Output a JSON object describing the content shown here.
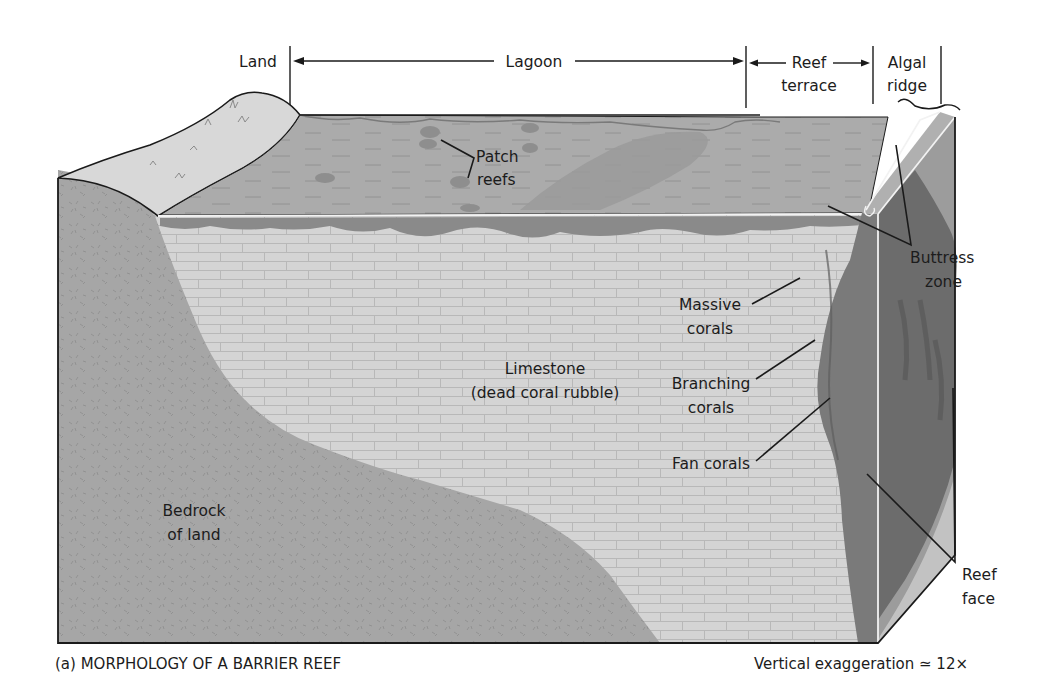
{
  "figure": {
    "caption": "(a) MORPHOLOGY OF A BARRIER REEF",
    "scale_note": "Vertical exaggeration ≃ 12×"
  },
  "zones_header": {
    "land": "Land",
    "lagoon": "Lagoon",
    "reef_terrace_line1": "Reef",
    "reef_terrace_line2": "terrace",
    "algal_ridge_line1": "Algal",
    "algal_ridge_line2": "ridge"
  },
  "labels": {
    "patch_reefs_line1": "Patch",
    "patch_reefs_line2": "reefs",
    "buttress_zone_line1": "Buttress",
    "buttress_zone_line2": "zone",
    "massive_corals_line1": "Massive",
    "massive_corals_line2": "corals",
    "branching_corals_line1": "Branching",
    "branching_corals_line2": "corals",
    "fan_corals": "Fan corals",
    "limestone_line1": "Limestone",
    "limestone_line2": "(dead coral rubble)",
    "bedrock_line1": "Bedrock",
    "bedrock_line2": "of land",
    "reef_face_line1": "Reef",
    "reef_face_line2": "face"
  },
  "colors": {
    "background": "#ffffff",
    "land_surface": "#d6d6d6",
    "lagoon_water": "#a9a9a9",
    "lagoon_sand_bar": "#959595",
    "bedrock": "#a4a4a4",
    "limestone": "#d4d4d4",
    "limestone_joints": "#b5b5b5",
    "reef_front": "#777777",
    "reef_dark": "#5e5e5e",
    "side_face": "#9a9a9a",
    "outline": "#1a1a1a",
    "highlight": "#f2f2f2"
  }
}
